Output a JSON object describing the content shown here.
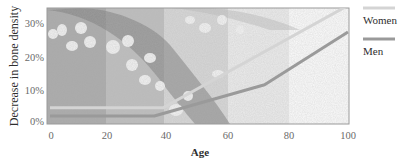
{
  "chart_data": {
    "type": "line",
    "title": "",
    "xlabel": "Age",
    "ylabel": "Decrease in bone density",
    "xlim": [
      0,
      100
    ],
    "ylim": [
      0,
      35
    ],
    "x_ticks": [
      "0",
      "20",
      "40",
      "60",
      "80",
      "100"
    ],
    "y_ticks": [
      "0%",
      "10%",
      "20%",
      "30%"
    ],
    "grid": false,
    "legend_position": "right",
    "background": "bone tissue micrograph in vertical bands fading lighter with age",
    "series": [
      {
        "name": "Women",
        "color": "#d4d4d4",
        "points": [
          [
            0,
            4
          ],
          [
            38,
            4
          ],
          [
            100,
            35
          ]
        ]
      },
      {
        "name": "Men",
        "color": "#9a9a9a",
        "points": [
          [
            0,
            1.5
          ],
          [
            35,
            1.5
          ],
          [
            72,
            11
          ],
          [
            100,
            27
          ]
        ]
      }
    ]
  },
  "legend": {
    "items": [
      {
        "label": "Women",
        "color": "#d4d4d4"
      },
      {
        "label": "Men",
        "color": "#9a9a9a"
      }
    ]
  },
  "axes": {
    "x_title": "Age",
    "y_title": "Decrease in bone density",
    "x_ticks": [
      "0",
      "20",
      "40",
      "60",
      "80",
      "100"
    ],
    "y_ticks": [
      "0%",
      "10%",
      "20%",
      "30%"
    ]
  }
}
